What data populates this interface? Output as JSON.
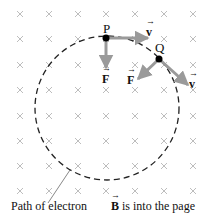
{
  "diagram": {
    "labels": {
      "point_p": "P",
      "point_q": "Q",
      "velocity_p": "v",
      "force_p": "F",
      "velocity_q": "v",
      "force_q": "F",
      "path_caption": "Path of electron",
      "field_symbol": "B",
      "field_caption": " is into the page"
    },
    "colors": {
      "cross": "#bdbdbd",
      "arrow": "#9a9a9a",
      "path": "#222222",
      "point": "#000000"
    }
  }
}
